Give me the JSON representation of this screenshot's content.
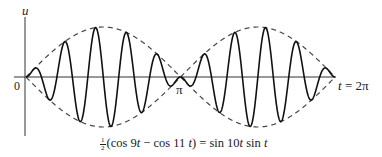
{
  "chart_data": {
    "type": "line",
    "title": "",
    "xlabel": "t",
    "ylabel": "u",
    "xlim": [
      0,
      6.2832
    ],
    "ylim": [
      -1,
      1
    ],
    "grid": false,
    "tick_labels": {
      "origin": "0",
      "mid": "π",
      "end": "t = 2π"
    },
    "series": [
      {
        "name": "sin 10t sin t",
        "style": "solid",
        "formula": "sin(10t)*sin(t)"
      },
      {
        "name": "envelope +sin t",
        "style": "dashed",
        "formula": "sin(t)"
      },
      {
        "name": "envelope -sin t",
        "style": "dashed",
        "formula": "-sin(t)"
      }
    ],
    "caption": "½(cos 9t − cos 11 t) = sin 10t sin t"
  },
  "labels": {
    "u_axis": "u",
    "origin": "0",
    "pi": "π",
    "t_end_var": "t",
    "t_end_rest": " = 2π"
  },
  "caption": {
    "frac_num": "1",
    "frac_den": "2",
    "part1": "(cos 9",
    "t1": "t",
    "part2": " − cos 11 ",
    "t2": "t",
    "part3": ") = sin 10",
    "t3": "t",
    "part4": " sin ",
    "t4": "t"
  },
  "style": {
    "curve_color": "#111111",
    "envelope_color": "#444444",
    "axis_color": "#333333"
  },
  "geometry": {
    "origin_x": 26,
    "axis_y": 77,
    "x_scale": 49.2,
    "y_scale": 50,
    "u_axis_top": 17,
    "u_axis_bottom": 136,
    "t_axis_left": 14,
    "t_axis_right": 336
  }
}
